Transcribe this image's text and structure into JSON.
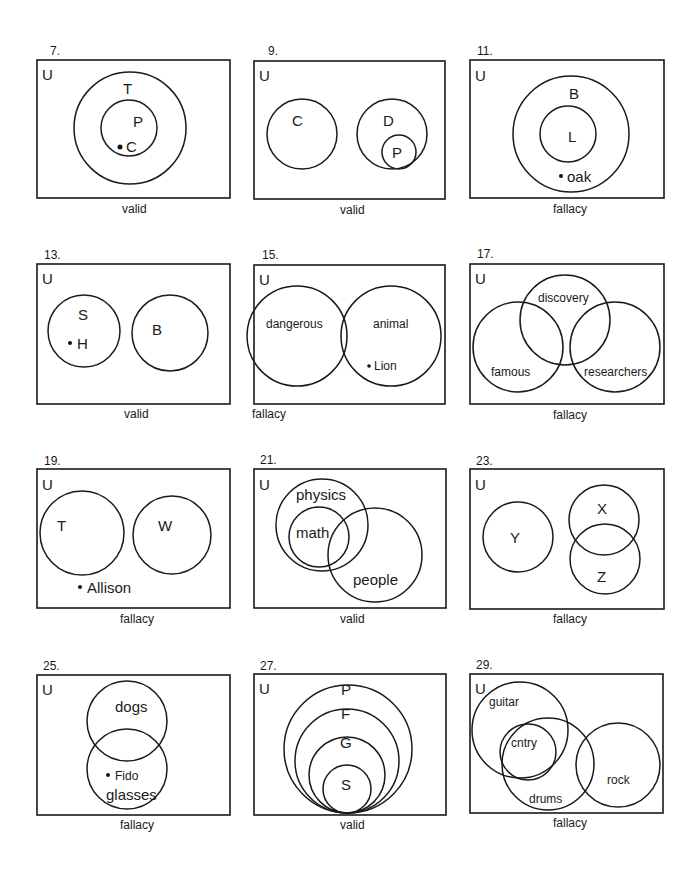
{
  "universe_label": "U",
  "panels": [
    {
      "number": "7.",
      "verdict": "valid",
      "labels": {
        "T": "T",
        "P": "P",
        "C": "C"
      }
    },
    {
      "number": "9.",
      "verdict": "valid",
      "labels": {
        "C": "C",
        "D": "D",
        "P": "P"
      }
    },
    {
      "number": "11.",
      "verdict": "fallacy",
      "labels": {
        "B": "B",
        "L": "L",
        "oak": "oak"
      }
    },
    {
      "number": "13.",
      "verdict": "valid",
      "labels": {
        "S": "S",
        "H": "H",
        "B": "B"
      }
    },
    {
      "number": "15.",
      "verdict": "fallacy",
      "labels": {
        "dangerous": "dangerous",
        "animal": "animal",
        "Lion": "Lion"
      }
    },
    {
      "number": "17.",
      "verdict": "fallacy",
      "labels": {
        "discovery": "discovery",
        "famous": "famous",
        "researchers": "researchers"
      }
    },
    {
      "number": "19.",
      "verdict": "fallacy",
      "labels": {
        "T": "T",
        "W": "W",
        "Allison": "Allison"
      }
    },
    {
      "number": "21.",
      "verdict": "valid",
      "labels": {
        "physics": "physics",
        "math": "math",
        "people": "people"
      }
    },
    {
      "number": "23.",
      "verdict": "fallacy",
      "labels": {
        "Y": "Y",
        "X": "X",
        "Z": "Z"
      }
    },
    {
      "number": "25.",
      "verdict": "fallacy",
      "labels": {
        "dogs": "dogs",
        "Fido": "Fido",
        "glasses": "glasses"
      }
    },
    {
      "number": "27.",
      "verdict": "valid",
      "labels": {
        "P": "P",
        "F": "F",
        "G": "G",
        "S": "S"
      }
    },
    {
      "number": "29.",
      "verdict": "fallacy",
      "labels": {
        "guitar": "guitar",
        "cntry": "cntry",
        "drums": "drums",
        "rock": "rock"
      }
    }
  ]
}
